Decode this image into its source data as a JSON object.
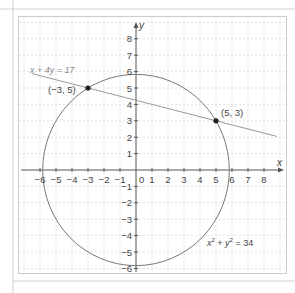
{
  "chart_data": {
    "type": "scatter",
    "title": "",
    "xlabel": "x",
    "ylabel": "y",
    "xlim": [
      -6.5,
      9
    ],
    "ylim": [
      -6.2,
      9.5
    ],
    "grid": true,
    "x_ticks": [
      "-6",
      "-5",
      "-4",
      "-3",
      "-2",
      "-1",
      "1",
      "2",
      "3",
      "4",
      "5",
      "6",
      "7",
      "8"
    ],
    "y_ticks": [
      "-6",
      "-5",
      "-4",
      "-3",
      "-2",
      "-1",
      "1",
      "2",
      "3",
      "4",
      "5",
      "6",
      "7",
      "8"
    ],
    "origin_label": "0",
    "series": [
      {
        "name": "x^2 + y^2 = 34",
        "kind": "circle",
        "center": [
          0,
          0
        ],
        "radius": 5.831
      },
      {
        "name": "x + 4y = 17",
        "kind": "line",
        "points": [
          [
            -6.5,
            5.875
          ],
          [
            8.8,
            2.05
          ]
        ]
      }
    ],
    "points": [
      {
        "label": "(−3, 5)",
        "x": -3,
        "y": 5
      },
      {
        "label": "(5, 3)",
        "x": 5,
        "y": 3
      }
    ],
    "annotations": [
      {
        "text": "x + 4y = 17",
        "x": -6.3,
        "y": 6.3
      },
      {
        "text": "x² + y² = 34",
        "x": 3.6,
        "y": -4.6
      }
    ]
  },
  "labels": {
    "line_eq": "x + 4y = 17",
    "circle_eq_x": "x",
    "circle_eq_y": "y",
    "circle_eq_rest": " = 34",
    "circle_eq_plus": " + ",
    "sup": "2",
    "point_a": "(−3, 5)",
    "point_b": "(5, 3)",
    "x_axis": "x",
    "y_axis": "y",
    "origin": "0"
  },
  "colors": {
    "axis": "#555555",
    "curve": "#777777",
    "grid": "#d9d9d9",
    "point": "#222222",
    "text": "#444444",
    "eq_text": "#888888"
  }
}
